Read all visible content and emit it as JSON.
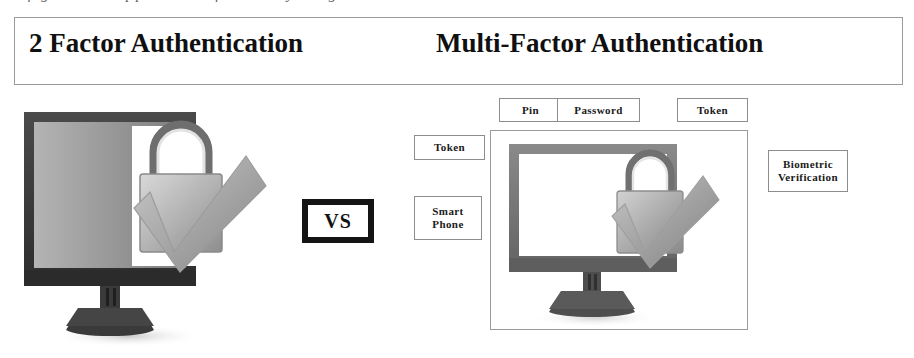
{
  "page": {
    "top_cropped_text": "figure 1 : Apparatus of security diagram",
    "background_color": "#ffffff",
    "frame_border_color": "#9a9a9a",
    "text_color": "#111111"
  },
  "heading": {
    "left_title": "2 Factor Authentication",
    "right_title": "Multi-Factor Authentication"
  },
  "comparison": {
    "vs_label": "VS"
  },
  "two_factor": {
    "illustration_name": "monitor-with-padlock-and-checkmark",
    "monitor_screen_color": "#8f8f8f",
    "monitor_frame_color": "#3c3c3c"
  },
  "multi_factor": {
    "illustration_name": "monitor-with-padlock-and-checkmark",
    "monitor_screen_color": "#ffffff",
    "monitor_frame_color": "#6a6a6a",
    "factors_top": [
      {
        "label": "Pin"
      },
      {
        "label": "Password"
      },
      {
        "label": "Token"
      }
    ],
    "factors_left": [
      {
        "label": "Token"
      },
      {
        "label": "Smart\nPhone",
        "line1": "Smart",
        "line2": "Phone"
      }
    ],
    "factors_right": [
      {
        "label": "Biometric\nVerification",
        "line1": "Biometric",
        "line2": "Verification"
      }
    ]
  }
}
